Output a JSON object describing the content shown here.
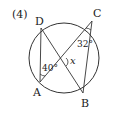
{
  "problem_number": "(4)",
  "points": {
    "D": {
      "label": "D",
      "x": 41,
      "y": 28
    },
    "C": {
      "label": "C",
      "x": 92,
      "y": 21
    },
    "A": {
      "label": "A",
      "x": 40,
      "y": 82
    },
    "B": {
      "label": "B",
      "x": 83,
      "y": 93
    }
  },
  "circle": {
    "cx": 64,
    "cy": 58,
    "r": 35
  },
  "angles": {
    "angle_A": "40°",
    "angle_C": "32°",
    "angle_x": "x"
  },
  "colors": {
    "stroke": "#333333",
    "text": "#222222"
  }
}
